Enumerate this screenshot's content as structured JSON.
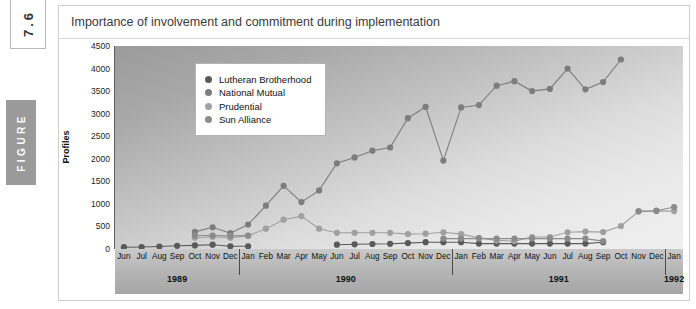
{
  "figure": {
    "number": "7.6",
    "word": "FIGURE"
  },
  "card": {
    "title": "Importance of involvement and commitment during implementation"
  },
  "legend": {
    "items": [
      {
        "label": "Lutheran Brotherhood",
        "color": "#5a5a5a"
      },
      {
        "label": "National Mutual",
        "color": "#7d7d7d"
      },
      {
        "label": "Prudential",
        "color": "#a0a0a0"
      },
      {
        "label": "Sun Alliance",
        "color": "#8b8b8b"
      }
    ]
  },
  "chart_data": {
    "type": "line",
    "title": "Importance of involvement and commitment during implementation",
    "xlabel": "",
    "ylabel": "Profiles",
    "ylim": [
      0,
      4500
    ],
    "ytick_step": 500,
    "yticks": [
      0,
      500,
      1000,
      1500,
      2000,
      2500,
      3000,
      3500,
      4000,
      4500
    ],
    "grid": false,
    "legend_position": "top-left-inside",
    "x": [
      "Jun",
      "Jul",
      "Aug",
      "Sep",
      "Oct",
      "Nov",
      "Dec",
      "Jan",
      "Feb",
      "Mar",
      "Apr",
      "May",
      "Jun",
      "Jul",
      "Aug",
      "Sep",
      "Oct",
      "Nov",
      "Dec",
      "Jan",
      "Feb",
      "Mar",
      "Apr",
      "May",
      "Jun",
      "Jul",
      "Aug",
      "Sep",
      "Oct",
      "Nov",
      "Dec",
      "Jan"
    ],
    "years": [
      {
        "label": "1989",
        "start_index": 0,
        "end_index": 6
      },
      {
        "label": "1990",
        "start_index": 7,
        "end_index": 18
      },
      {
        "label": "1991",
        "start_index": 19,
        "end_index": 30
      },
      {
        "label": "1992",
        "start_index": 31,
        "end_index": 31
      }
    ],
    "series": [
      {
        "name": "Lutheran Brotherhood",
        "color": "#5a5a5a",
        "values": [
          40,
          45,
          55,
          70,
          80,
          95,
          60,
          60,
          null,
          null,
          null,
          null,
          95,
          105,
          110,
          115,
          130,
          150,
          150,
          150,
          120,
          120,
          120,
          120,
          120,
          120,
          120,
          150,
          null,
          null,
          null,
          null
        ]
      },
      {
        "name": "National Mutual",
        "color": "#7d7d7d",
        "values": [
          null,
          null,
          null,
          null,
          380,
          480,
          350,
          540,
          960,
          1400,
          1040,
          1300,
          1900,
          2030,
          2180,
          2250,
          2900,
          3150,
          1960,
          3140,
          3190,
          3620,
          3720,
          3500,
          3550,
          4000,
          3540,
          3700,
          4200,
          null,
          null,
          null
        ]
      },
      {
        "name": "Prudential",
        "color": "#a0a0a0",
        "values": [
          null,
          null,
          null,
          null,
          250,
          270,
          250,
          290,
          450,
          650,
          730,
          450,
          360,
          360,
          360,
          360,
          330,
          340,
          370,
          330,
          245,
          190,
          175,
          265,
          265,
          370,
          385,
          375,
          510,
          830,
          840,
          840
        ]
      },
      {
        "name": "Sun Alliance",
        "color": "#8b8b8b",
        "values": [
          null,
          null,
          null,
          null,
          300,
          300,
          290,
          300,
          null,
          null,
          null,
          null,
          null,
          null,
          null,
          null,
          null,
          null,
          230,
          230,
          230,
          230,
          230,
          230,
          230,
          230,
          230,
          175,
          null,
          840,
          850,
          930
        ]
      }
    ]
  }
}
